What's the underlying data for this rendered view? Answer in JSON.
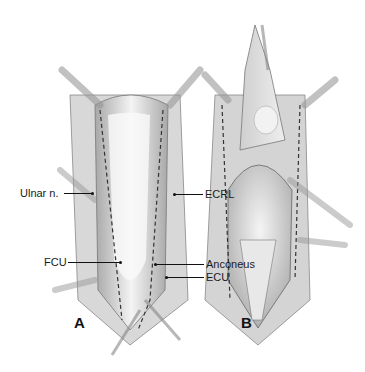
{
  "figure": {
    "panels": [
      {
        "id": "A",
        "label": "A"
      },
      {
        "id": "B",
        "label": "B"
      }
    ],
    "labels": {
      "ulnar_n": "Ulnar n.",
      "fcu": "FCU",
      "ecrl": "ECRL",
      "anconeus": "Anconeus",
      "ecu": "ECU"
    },
    "colors": {
      "line": "#111111",
      "tissue_light": "#e6e6e6",
      "tissue_mid": "#b5b5b5",
      "tissue_dark": "#7a7a7a"
    }
  }
}
